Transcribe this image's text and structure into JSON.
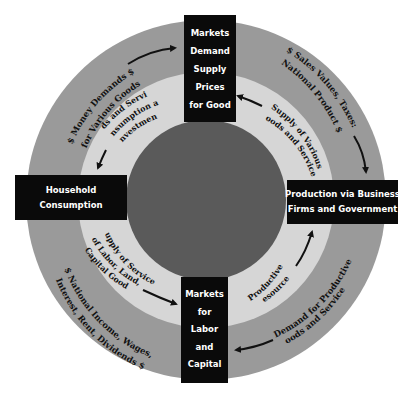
{
  "diagram": {
    "type": "circular-flow",
    "colors": {
      "background": "#ffffff",
      "outer_ring": "#9a9a9a",
      "middle_ring": "#d6d6d6",
      "inner_core": "#5a5a5a",
      "boxes": "#0a0a0a",
      "box_text": "#ffffff",
      "ring_text": "#111111",
      "arrows": "#111111"
    },
    "nodes": {
      "top": {
        "lines": [
          "Markets",
          "Demand",
          "Supply",
          "Prices",
          "for Good"
        ]
      },
      "bottom": {
        "lines": [
          "Markets",
          "for",
          "Labor",
          "and",
          "Capital"
        ]
      },
      "left": {
        "lines": [
          "Household",
          "Consumption"
        ]
      },
      "right": {
        "lines": [
          "Production via Business",
          "Firms and Government"
        ]
      }
    },
    "outer_ring_labels": {
      "top_left": {
        "line1": "$  Money Demands  $",
        "line2": "for Various Goods"
      },
      "top_right": {
        "line1": "$  Sales Values, Taxes:",
        "line2": "National Product  $"
      },
      "bottom_left": {
        "line1": "$  National Income, Wages,",
        "line2": "Interest, Rent, Dividends  $"
      },
      "bottom_right": {
        "line1": "$  Demand for Productive  $",
        "line2": "Goods and Services"
      }
    },
    "inner_ring_labels": {
      "top_left": {
        "line1": "Goods and Services:",
        "line2": "Consumption and",
        "line3": "Investment"
      },
      "top_right": {
        "line1": "Supply of Various",
        "line2": "Goods and Services"
      },
      "bottom_left": {
        "line1": "Supply of Services",
        "line2": "of Labor, Land,",
        "line3": "Capital Goods"
      },
      "bottom_right": {
        "line1": "Productive",
        "line2": "Resources"
      }
    },
    "flows": [
      {
        "ring": "outer",
        "from": "Household Consumption",
        "to": "Markets Demand Supply Prices for Good",
        "label": "Money Demands for Various Goods"
      },
      {
        "ring": "outer",
        "from": "Markets Demand Supply Prices for Good",
        "to": "Production via Business Firms and Government",
        "label": "Sales Values, Taxes: National Product"
      },
      {
        "ring": "outer",
        "from": "Production via Business Firms and Government",
        "to": "Markets for Labor and Capital",
        "label": "Demand for Productive Goods and Services"
      },
      {
        "ring": "outer",
        "from": "Markets for Labor and Capital",
        "to": "Household Consumption",
        "label": "National Income, Wages, Interest, Rent, Dividends"
      },
      {
        "ring": "inner",
        "from": "Production via Business Firms and Government",
        "to": "Markets Demand Supply Prices for Good",
        "label": "Supply of Various Goods and Services"
      },
      {
        "ring": "inner",
        "from": "Markets Demand Supply Prices for Good",
        "to": "Household Consumption",
        "label": "Goods and Services: Consumption and Investment"
      },
      {
        "ring": "inner",
        "from": "Household Consumption",
        "to": "Markets for Labor and Capital",
        "label": "Supply of Services of Labor, Land, Capital Goods"
      },
      {
        "ring": "inner",
        "from": "Markets for Labor and Capital",
        "to": "Production via Business Firms and Government",
        "label": "Productive Resources"
      }
    ]
  }
}
